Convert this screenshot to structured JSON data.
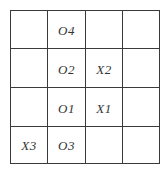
{
  "grid": {
    "rows": 4,
    "cols": 4,
    "cells": [
      [
        "",
        "O4",
        "",
        ""
      ],
      [
        "",
        "O2",
        "X2",
        ""
      ],
      [
        "",
        "O1",
        "X1",
        ""
      ],
      [
        "X3",
        "O3",
        "",
        ""
      ]
    ]
  },
  "colors": {
    "line": "#3a3a3a",
    "text": "#333333",
    "background": "#ffffff"
  }
}
